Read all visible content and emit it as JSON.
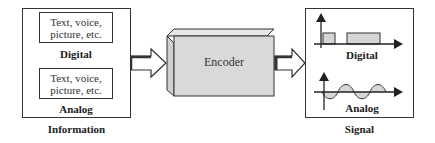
{
  "information": {
    "caption": "Information",
    "digital": {
      "content": "Text, voice, picture, etc.",
      "line1": "Text, voice,",
      "line2": "picture, etc.",
      "label": "Digital"
    },
    "analog": {
      "content": "Text, voice, picture, etc.",
      "line1": "Text, voice,",
      "line2": "picture, etc.",
      "label": "Analog"
    }
  },
  "encoder": {
    "label": "Encoder",
    "fill": "#d9d9d9"
  },
  "signal": {
    "caption": "Signal",
    "digital": {
      "label": "Digital"
    },
    "analog": {
      "label": "Analog"
    }
  },
  "colors": {
    "stroke": "#333333",
    "fill_gray": "#d6d6d6",
    "background": "#ffffff"
  }
}
